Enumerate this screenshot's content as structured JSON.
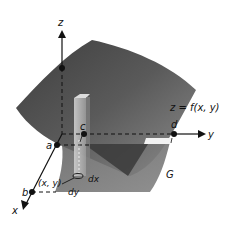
{
  "figure": {
    "axes": {
      "x_label": "x",
      "y_label": "y",
      "z_label": "z"
    },
    "points": {
      "a": "a",
      "b": "b",
      "c": "c",
      "d": "d"
    },
    "surface_label": "z = f(x, y)",
    "region_label": "G",
    "element": {
      "point_label": "(x, y)",
      "dx_label": "dx",
      "dy_label": "dy"
    },
    "colors": {
      "surface_dark": "#4a4a4a",
      "surface_light": "#8a8a8a",
      "region": "#7a7a7a",
      "region_dark": "#3c3c3c",
      "axis": "#111111",
      "column": "#b8b8b8"
    }
  }
}
